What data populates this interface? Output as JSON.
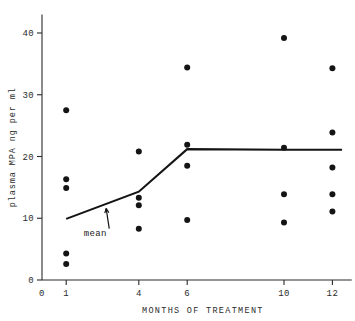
{
  "chart_data": {
    "type": "scatter",
    "title": "",
    "xlabel": "MONTHS OF TREATMENT",
    "ylabel": "plasma MPA ng per ml",
    "xlim": [
      0,
      12.8
    ],
    "ylim": [
      0,
      43
    ],
    "grid": false,
    "legend": null,
    "xticks": [
      0,
      1,
      4,
      6,
      10,
      12
    ],
    "xticklabels": [
      "0",
      "1",
      "4",
      "6",
      "10",
      "12"
    ],
    "yticks": [
      0,
      10,
      20,
      30,
      40
    ],
    "yticklabels": [
      "0",
      "10",
      "20",
      "30",
      "40"
    ],
    "points": [
      {
        "x": 1,
        "y": 27.5
      },
      {
        "x": 1,
        "y": 16.3
      },
      {
        "x": 1,
        "y": 14.9
      },
      {
        "x": 1,
        "y": 4.3
      },
      {
        "x": 1,
        "y": 2.6
      },
      {
        "x": 4,
        "y": 20.8
      },
      {
        "x": 4,
        "y": 13.3
      },
      {
        "x": 4,
        "y": 12.1
      },
      {
        "x": 4,
        "y": 8.3
      },
      {
        "x": 6,
        "y": 34.4
      },
      {
        "x": 6,
        "y": 21.9
      },
      {
        "x": 6,
        "y": 18.5
      },
      {
        "x": 6,
        "y": 9.7
      },
      {
        "x": 10,
        "y": 39.2
      },
      {
        "x": 10,
        "y": 21.4
      },
      {
        "x": 10,
        "y": 13.9
      },
      {
        "x": 10,
        "y": 9.3
      },
      {
        "x": 12,
        "y": 34.3
      },
      {
        "x": 12,
        "y": 23.9
      },
      {
        "x": 12,
        "y": 18.2
      },
      {
        "x": 12,
        "y": 13.9
      },
      {
        "x": 12,
        "y": 11.1
      }
    ],
    "series": [
      {
        "name": "mean",
        "type": "line",
        "x": [
          1,
          4,
          6,
          10,
          12.4
        ],
        "values": [
          9.9,
          14.3,
          21.2,
          21.1,
          21.1
        ]
      }
    ],
    "annotations": [
      {
        "text": "mean",
        "x": 2.2,
        "y": 7.2,
        "arrow_to_x": 2.65,
        "arrow_to_y": 11.6
      }
    ],
    "colors": {
      "point": "#141414",
      "line": "#141414",
      "axis": "#2a2a2a",
      "background": "#ffffff"
    }
  }
}
